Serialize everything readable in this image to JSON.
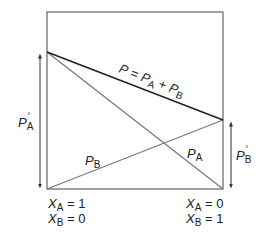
{
  "diagram": {
    "total_line_label": {
      "P": "P",
      "eq": " = ",
      "PA": "P",
      "PA_sub": "A",
      "plus": " + ",
      "PB": "P",
      "PB_sub": "B"
    },
    "line_PA_label": {
      "main": "P",
      "sub": "A"
    },
    "line_PB_label": {
      "main": "P",
      "sub": "B"
    },
    "left_pressure_label": {
      "main": "P",
      "sub": "A",
      "sup": "°"
    },
    "right_pressure_label": {
      "main": "P",
      "sub": "B",
      "sup": "°"
    },
    "left_axis": {
      "xa": {
        "main": "X",
        "sub": "A",
        "value": " = 1"
      },
      "xb": {
        "main": "X",
        "sub": "B",
        "value": " = 0"
      }
    },
    "right_axis": {
      "xa": {
        "main": "X",
        "sub": "A",
        "value": " = 0"
      },
      "xb": {
        "main": "X",
        "sub": "B",
        "value": " = 1"
      }
    },
    "colors": {
      "frame": "#444444",
      "total_line": "#222222",
      "component_lines": "#7a7a7a",
      "arrows": "#333333"
    }
  }
}
